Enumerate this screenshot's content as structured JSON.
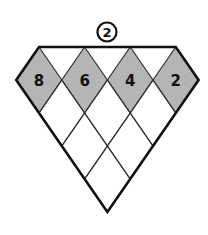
{
  "puzzle": {
    "label": "2",
    "label_style": "circled",
    "top_row": [
      {
        "value": "8",
        "shaded": true
      },
      {
        "value": "6",
        "shaded": true
      },
      {
        "value": "4",
        "shaded": true
      },
      {
        "value": "2",
        "shaded": true
      }
    ],
    "rows": [
      {
        "row": 1,
        "cells": [
          "8",
          "6",
          "4",
          "2"
        ]
      },
      {
        "row": 2,
        "cells": [
          "",
          "",
          ""
        ]
      },
      {
        "row": 3,
        "cells": [
          "",
          ""
        ]
      },
      {
        "row": 4,
        "cells": [
          ""
        ]
      }
    ],
    "colors": {
      "shaded_fill": "#b5b5b5",
      "empty_fill": "#ffffff",
      "outline": "#111111",
      "grid_line": "#333333"
    }
  }
}
